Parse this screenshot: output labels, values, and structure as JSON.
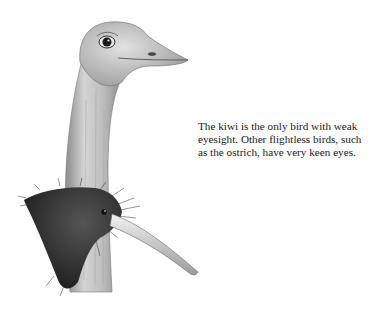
{
  "figure": {
    "subjects": [
      "ostrich-head",
      "kiwi-head"
    ],
    "colors": {
      "ink": "#1a1a1a",
      "ostrich_skin": "#bdbdbd",
      "kiwi_feathers": "#3a3a3a",
      "background": "#ffffff"
    }
  },
  "caption": {
    "text": "The kiwi is the only bird with weak eyesight. Other flightless birds, such as the ostrich, have very keen eyes."
  }
}
